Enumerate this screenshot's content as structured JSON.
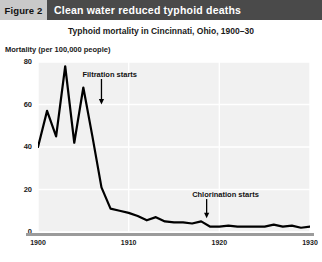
{
  "header": {
    "figure_tag": "Figure 2",
    "banner_title": "Clean water reduced typhoid deaths",
    "tag_bg": "#c9c9c9",
    "banner_bg": "#4a4a4a",
    "banner_text_color": "#ffffff"
  },
  "chart_data": {
    "type": "line",
    "title": "Typhoid mortality in Cincinnati, Ohio, 1900–30",
    "xlabel": "",
    "ylabel": "Mortality (per 100,000 people)",
    "xlim": [
      1900,
      1930
    ],
    "ylim": [
      0,
      80
    ],
    "xticks": [
      1900,
      1910,
      1920,
      1930
    ],
    "xtick_labels": [
      "1900",
      "1910",
      "1920",
      "1930"
    ],
    "yticks": [
      0,
      20,
      40,
      60,
      80
    ],
    "ytick_labels": [
      "0",
      "20",
      "40",
      "60",
      "80"
    ],
    "grid": true,
    "legend": false,
    "line_color": "#000000",
    "plot_bg": "#f1f1f1",
    "grid_color": "#ffffff",
    "series": [
      {
        "name": "Typhoid mortality",
        "x": [
          1900,
          1901,
          1902,
          1903,
          1904,
          1905,
          1906,
          1907,
          1908,
          1909,
          1910,
          1911,
          1912,
          1913,
          1914,
          1915,
          1916,
          1917,
          1918,
          1919,
          1920,
          1921,
          1922,
          1923,
          1924,
          1925,
          1926,
          1927,
          1928,
          1929,
          1930
        ],
        "values": [
          40,
          57,
          45,
          78,
          42,
          68,
          45,
          21,
          11,
          10,
          9,
          7.5,
          5.5,
          7,
          5,
          4.5,
          4.5,
          4,
          5,
          2.5,
          2.5,
          3,
          2.5,
          2.5,
          2.5,
          2.5,
          3.5,
          2.5,
          3,
          2,
          2.5
        ]
      }
    ],
    "annotations": [
      {
        "id": "filtration",
        "label": "Filtration starts",
        "text_x": 1904.9,
        "text_y": 74,
        "arrow_x": 1907.0,
        "arrow_y_top": 72,
        "arrow_y_bottom": 60
      },
      {
        "id": "chlorination",
        "label": "Chlorination starts",
        "text_x": 1917.0,
        "text_y": 17.5,
        "arrow_x": 1918.6,
        "arrow_y_top": 15.5,
        "arrow_y_bottom": 6.5
      }
    ]
  }
}
